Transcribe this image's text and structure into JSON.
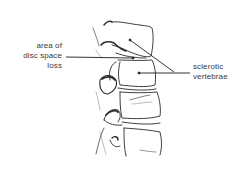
{
  "diagram": {
    "colors": {
      "background": "#ffffff",
      "line": "#2a2a2a",
      "text": "#3a3a3a"
    },
    "labels": {
      "disc_space": {
        "line1": "area of",
        "line2": "disc space",
        "line3": "loss"
      },
      "sclerotic": {
        "line1": "sclerotic",
        "line2": "vertebrae"
      }
    }
  }
}
